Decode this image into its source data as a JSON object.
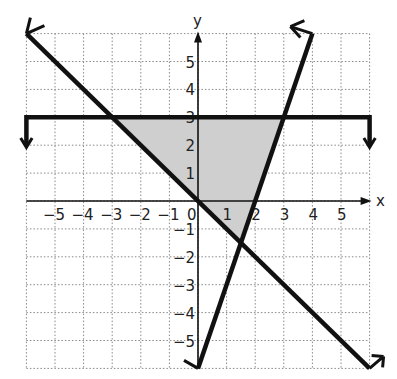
{
  "chart_data": {
    "type": "line",
    "title": "",
    "xlabel": "x",
    "ylabel": "y",
    "xlim": [
      -6,
      6
    ],
    "ylim": [
      -6,
      6
    ],
    "grid": true,
    "x_ticks": [
      -5,
      -4,
      -3,
      -2,
      -1,
      0,
      1,
      2,
      3,
      4,
      5
    ],
    "y_ticks": [
      -5,
      -4,
      -3,
      -2,
      -1,
      1,
      2,
      3,
      4,
      5
    ],
    "x_tick_labels": [
      "−5",
      "−4",
      "−3",
      "−2",
      "−1",
      "0",
      "1",
      "2",
      "3",
      "4",
      "5"
    ],
    "y_tick_labels": [
      "−5",
      "−4",
      "−3",
      "−2",
      "−1",
      "1",
      "2",
      "3",
      "4",
      "5"
    ],
    "series": [
      {
        "name": "y = 3",
        "equation": "y = 3",
        "points": [
          [
            -6,
            3
          ],
          [
            6,
            3
          ]
        ],
        "style": "solid",
        "end_arrows": "down-both"
      },
      {
        "name": "y = -x",
        "equation": "y = -x",
        "points": [
          [
            -6,
            6
          ],
          [
            6,
            -6
          ]
        ],
        "style": "solid",
        "end_arrows": "both"
      },
      {
        "name": "y = 3x - 6",
        "equation": "y = 3x - 6",
        "points": [
          [
            0,
            -6
          ],
          [
            4,
            6
          ]
        ],
        "style": "solid",
        "end_arrows": "both"
      }
    ],
    "shaded_region": {
      "vertices": [
        [
          -3,
          3
        ],
        [
          3,
          3
        ],
        [
          1.5,
          -1.5
        ]
      ],
      "color": "#cfcfcf"
    },
    "colors": {
      "line": "#111111",
      "grid": "#888888",
      "shade": "#cfcfcf"
    }
  }
}
